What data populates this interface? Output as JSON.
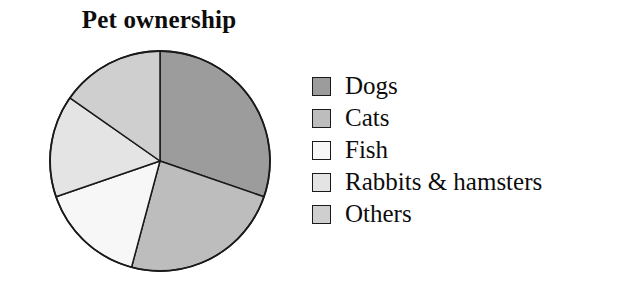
{
  "chart_data": {
    "type": "pie",
    "title": "Pet ownership",
    "xlabel": "",
    "ylabel": "",
    "legend_position": "right",
    "grid": false,
    "start_angle_deg": 0,
    "direction": "clockwise",
    "categories": [
      "Dogs",
      "Cats",
      "Fish",
      "Rabbits & hamsters",
      "Others"
    ],
    "values": [
      30,
      24,
      16,
      15,
      15
    ],
    "unit": "percent",
    "slice_angles_deg": [
      109,
      86,
      56,
      54,
      55
    ],
    "slice_boundaries_deg": [
      0,
      109,
      195,
      251,
      305,
      360
    ],
    "colors": [
      "#9c9c9c",
      "#bdbdbd",
      "#f7f7f7",
      "#e4e4e4",
      "#cfcfcf"
    ],
    "slices": [
      {
        "label": "Dogs",
        "value": 30,
        "angle_deg": 109,
        "color": "#9c9c9c"
      },
      {
        "label": "Cats",
        "value": 24,
        "angle_deg": 86,
        "color": "#bdbdbd"
      },
      {
        "label": "Fish",
        "value": 16,
        "angle_deg": 56,
        "color": "#f7f7f7"
      },
      {
        "label": "Rabbits & hamsters",
        "value": 15,
        "angle_deg": 54,
        "color": "#e4e4e4"
      },
      {
        "label": "Others",
        "value": 15,
        "angle_deg": 55,
        "color": "#cfcfcf"
      }
    ]
  },
  "chart": {
    "title": "Pet ownership"
  },
  "legend": {
    "items": [
      {
        "label": "Dogs",
        "color": "#9c9c9c"
      },
      {
        "label": "Cats",
        "color": "#bdbdbd"
      },
      {
        "label": "Fish",
        "color": "#f7f7f7"
      },
      {
        "label": "Rabbits & hamsters",
        "color": "#e4e4e4"
      },
      {
        "label": "Others",
        "color": "#cfcfcf"
      }
    ]
  },
  "style": {
    "background": "#ffffff",
    "outline": "#1a1a1a",
    "text": "#0d0d0d"
  }
}
